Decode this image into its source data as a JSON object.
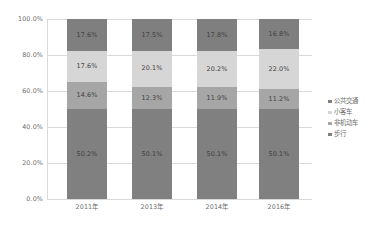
{
  "chart_data": {
    "type": "bar",
    "subtype": "100% stacked column",
    "title": "",
    "xlabel": "",
    "ylabel": "",
    "ylim": [
      0,
      100
    ],
    "ytick_labels": [
      "100.0%",
      "80.0%",
      "60.0%",
      "40.0%",
      "20.0%",
      "0.0%"
    ],
    "ytick_values": [
      100,
      80,
      60,
      40,
      20,
      0
    ],
    "grid": true,
    "legend_position": "right",
    "categories": [
      "2011年",
      "2013年",
      "2014年",
      "2016年"
    ],
    "series": [
      {
        "name": "公共交通",
        "color": "#7f7f7f",
        "values": [
          17.6,
          17.5,
          17.8,
          16.8
        ],
        "labels": [
          "17.6%",
          "17.5%",
          "17.8%",
          "16.8%"
        ]
      },
      {
        "name": "小客车",
        "color": "#d6d6d6",
        "values": [
          17.6,
          20.1,
          20.2,
          22.0
        ],
        "labels": [
          "17.6%",
          "20.1%",
          "20.2%",
          "22.0%"
        ]
      },
      {
        "name": "非机动车",
        "color": "#a6a6a6",
        "values": [
          14.6,
          12.3,
          11.9,
          11.2
        ],
        "labels": [
          "14.6%",
          "12.3%",
          "11.9%",
          "11.2%"
        ]
      },
      {
        "name": "步行",
        "color": "#808080",
        "values": [
          50.2,
          50.1,
          50.1,
          50.1
        ],
        "labels": [
          "50.2%",
          "50.1%",
          "50.1%",
          "50.1%"
        ]
      }
    ],
    "stack_order_bottom_to_top": [
      "步行",
      "非机动车",
      "小客车",
      "公共交通"
    ]
  },
  "legend": {
    "items": [
      {
        "label": "公共交通",
        "color": "#7f7f7f"
      },
      {
        "label": "小客车",
        "color": "#d6d6d6"
      },
      {
        "label": "非机动车",
        "color": "#a6a6a6"
      },
      {
        "label": "步行",
        "color": "#808080"
      }
    ]
  },
  "axes": {
    "y_ticks": [
      "100.0%",
      "80.0%",
      "60.0%",
      "40.0%",
      "20.0%",
      "0.0%"
    ],
    "x_ticks": [
      "2011年",
      "2013年",
      "2014年",
      "2016年"
    ]
  },
  "colors": {
    "gridline": "#d9d9d9",
    "axis_text": "#6d6d6d",
    "data_label": "#3f3f3f",
    "background": "#ffffff"
  }
}
